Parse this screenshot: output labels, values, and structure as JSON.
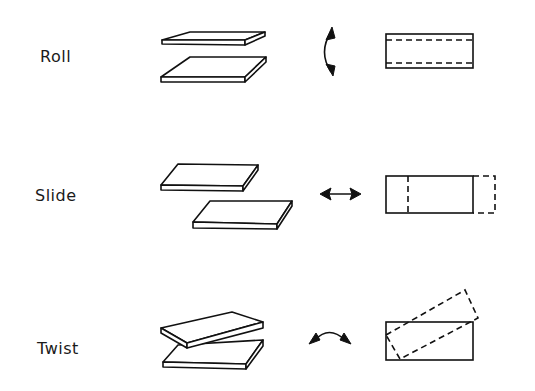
{
  "diagram": {
    "rows": [
      {
        "label": "Roll",
        "motion_symbol": "curved-vertical-double-arrow",
        "plan_view": "rectangle with two horizontal dashed lines near top and bottom edges"
      },
      {
        "label": "Slide",
        "motion_symbol": "horizontal-double-arrow",
        "plan_view": "rectangle with dashed vertical line and dashed extension to the right"
      },
      {
        "label": "Twist",
        "motion_symbol": "curved-horizontal-double-arrow",
        "plan_view": "rectangle overlaid with rotated dashed rectangle"
      }
    ],
    "colors": {
      "ink": "#111111",
      "background": "#ffffff"
    }
  }
}
